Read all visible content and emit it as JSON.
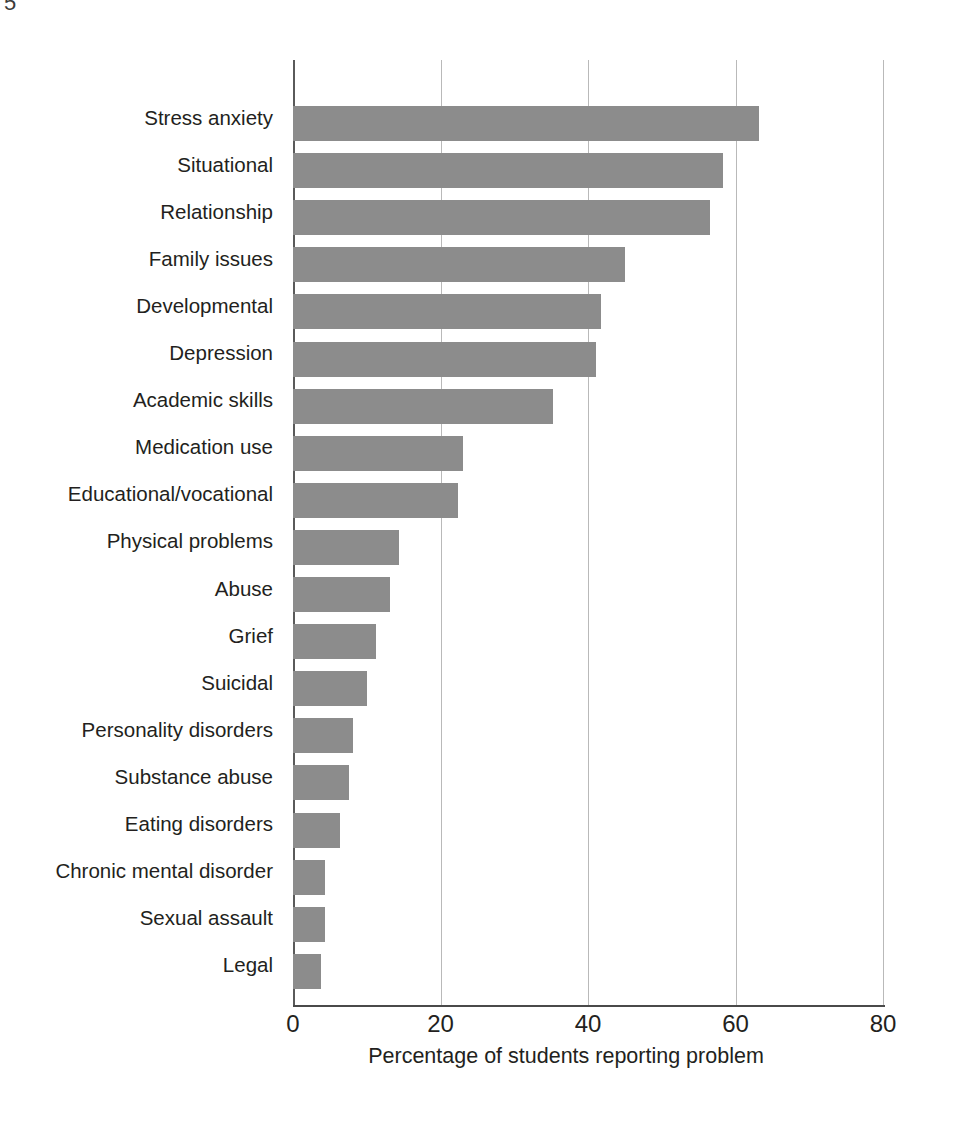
{
  "page": {
    "artifact_glyph": "5"
  },
  "chart_data": {
    "type": "bar",
    "orientation": "horizontal",
    "title": "",
    "subtitle": "",
    "xlabel": "Percentage of students reporting problem",
    "ylabel": "",
    "xlim": [
      0,
      80
    ],
    "xticks": [
      0,
      20,
      40,
      60,
      80
    ],
    "xtick_labels": [
      "0",
      "20",
      "40",
      "60",
      "80"
    ],
    "grid": "vertical",
    "legend": null,
    "bar_color": "#8c8c8c",
    "axis_color": "#4a4a4a",
    "gridline_color": "#b9b9b9",
    "text_color": "#231f20",
    "categories": [
      "Stress anxiety",
      "Situational",
      "Relationship",
      "Family issues",
      "Developmental",
      "Depression",
      "Academic skills",
      "Medication use",
      "Educational/vocational",
      "Physical problems",
      "Abuse",
      "Grief",
      "Suicidal",
      "Personality disorders",
      "Substance abuse",
      "Eating disorders",
      "Chronic mental disorder",
      "Sexual assault",
      "Legal"
    ],
    "values": [
      63.2,
      58.3,
      56.6,
      45.0,
      41.7,
      41.1,
      35.2,
      23.1,
      22.4,
      14.4,
      13.1,
      11.2,
      10.0,
      8.1,
      7.6,
      6.4,
      4.3,
      4.4,
      3.8
    ]
  }
}
